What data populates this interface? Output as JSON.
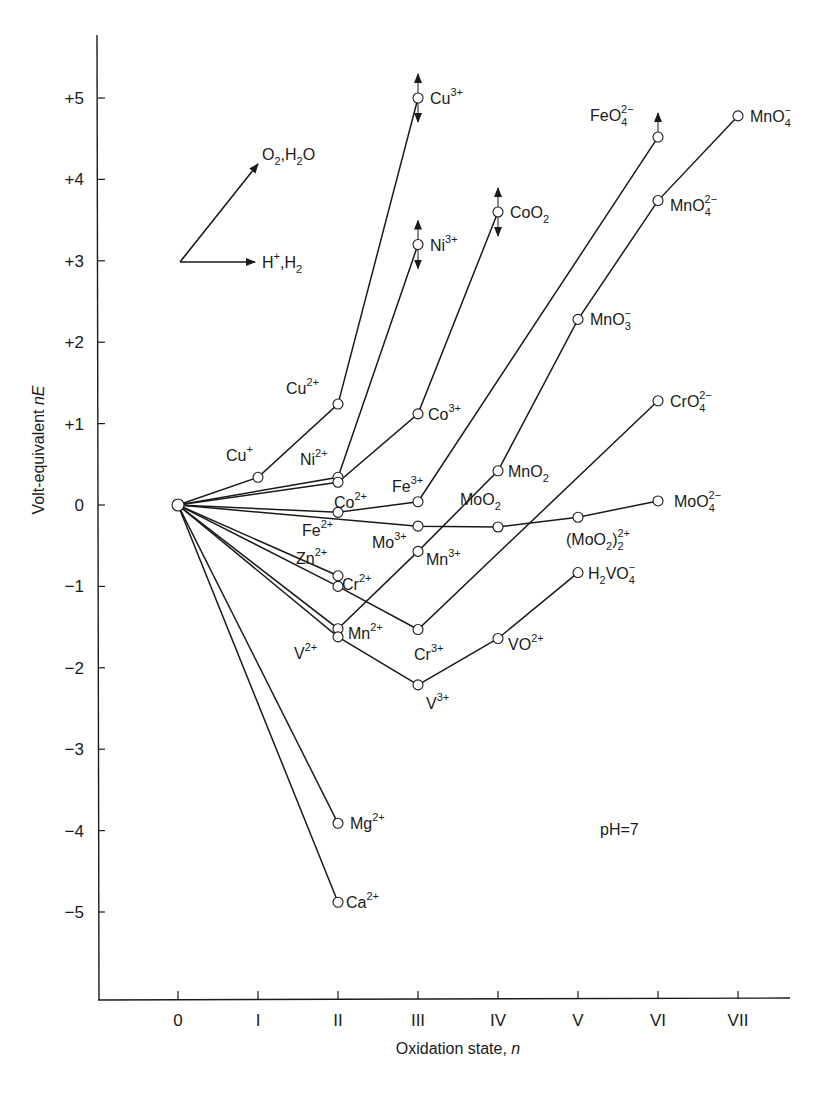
{
  "chart_data": {
    "type": "line",
    "title": "",
    "xlabel": "Oxidation state, n",
    "ylabel": "Volt-equivalent nE",
    "annotation": "pH=7",
    "legend_arrows": [
      {
        "label": "O2,H2O",
        "direction": "up-right"
      },
      {
        "label": "H+,H2",
        "direction": "right"
      }
    ],
    "x_ticks": [
      "0",
      "I",
      "II",
      "III",
      "IV",
      "V",
      "VI",
      "VII"
    ],
    "y_ticks": [
      "+5",
      "+4",
      "+3",
      "+2",
      "+1",
      "0",
      "−1",
      "−2",
      "−3",
      "−4",
      "−5"
    ],
    "xlim": [
      -1,
      7.5
    ],
    "ylim": [
      -6.3,
      5.8
    ],
    "grid": false,
    "origin_point": {
      "x": 0,
      "y": 0
    },
    "series": [
      {
        "name": "Cu",
        "points": [
          {
            "x": 0,
            "y": 0,
            "label": ""
          },
          {
            "x": 1,
            "y": 0.34,
            "label": "Cu⁺"
          },
          {
            "x": 2,
            "y": 1.24,
            "label": "Cu²⁺"
          },
          {
            "x": 3,
            "y": 5.0,
            "label": "Cu³⁺",
            "uncertain": true
          }
        ]
      },
      {
        "name": "Ni",
        "points": [
          {
            "x": 0,
            "y": 0,
            "label": ""
          },
          {
            "x": 2,
            "y": 0.34,
            "label": "Ni²⁺"
          },
          {
            "x": 3,
            "y": 3.2,
            "label": "Ni³⁺",
            "uncertain": true
          }
        ]
      },
      {
        "name": "Co",
        "points": [
          {
            "x": 0,
            "y": 0,
            "label": ""
          },
          {
            "x": 2,
            "y": 0.28,
            "label": "Co²⁺"
          },
          {
            "x": 3,
            "y": 1.12,
            "label": "Co³⁺"
          },
          {
            "x": 4,
            "y": 3.6,
            "label": "CoO₂",
            "uncertain": true
          }
        ]
      },
      {
        "name": "Fe",
        "points": [
          {
            "x": 0,
            "y": 0,
            "label": ""
          },
          {
            "x": 2,
            "y": -0.09,
            "label": "Fe²⁺"
          },
          {
            "x": 3,
            "y": 0.04,
            "label": "Fe³⁺"
          },
          {
            "x": 6,
            "y": 4.52,
            "label": "FeO₄²⁻",
            "uncertain": true
          }
        ]
      },
      {
        "name": "Mo",
        "points": [
          {
            "x": 0,
            "y": 0,
            "label": ""
          },
          {
            "x": 3,
            "y": -0.26,
            "label": "Mo³⁺"
          },
          {
            "x": 4,
            "y": -0.27,
            "label": "MoO₂"
          },
          {
            "x": 5,
            "y": -0.15,
            "label": "(MoO₂)₂²⁺"
          },
          {
            "x": 6,
            "y": 0.05,
            "label": "MoO₄²⁻"
          }
        ]
      },
      {
        "name": "Zn",
        "points": [
          {
            "x": 0,
            "y": 0,
            "label": ""
          },
          {
            "x": 2,
            "y": -0.87,
            "label": "Zn²⁺"
          }
        ]
      },
      {
        "name": "Cr",
        "points": [
          {
            "x": 0,
            "y": 0,
            "label": ""
          },
          {
            "x": 2,
            "y": -1.0,
            "label": "Cr²⁺"
          },
          {
            "x": 3,
            "y": -1.53,
            "label": "Cr³⁺"
          },
          {
            "x": 6,
            "y": 1.28,
            "label": "CrO₄²⁻"
          }
        ]
      },
      {
        "name": "Mn",
        "points": [
          {
            "x": 0,
            "y": 0,
            "label": ""
          },
          {
            "x": 2,
            "y": -1.52,
            "label": "Mn²⁺"
          },
          {
            "x": 3,
            "y": -0.57,
            "label": "Mn³⁺"
          },
          {
            "x": 4,
            "y": 0.42,
            "label": "MnO₂"
          },
          {
            "x": 5,
            "y": 2.28,
            "label": "MnO₃⁻"
          },
          {
            "x": 6,
            "y": 3.74,
            "label": "MnO₄²⁻"
          },
          {
            "x": 7,
            "y": 4.78,
            "label": "MnO₄⁻"
          }
        ]
      },
      {
        "name": "V",
        "points": [
          {
            "x": 0,
            "y": 0,
            "label": ""
          },
          {
            "x": 2,
            "y": -1.62,
            "label": "V²⁺"
          },
          {
            "x": 3,
            "y": -2.21,
            "label": "V³⁺"
          },
          {
            "x": 4,
            "y": -1.64,
            "label": "VO²⁺"
          },
          {
            "x": 5,
            "y": -0.83,
            "label": "H₂VO₄⁻"
          }
        ]
      },
      {
        "name": "Mg",
        "points": [
          {
            "x": 0,
            "y": 0,
            "label": ""
          },
          {
            "x": 2,
            "y": -3.91,
            "label": "Mg²⁺"
          }
        ]
      },
      {
        "name": "Ca",
        "points": [
          {
            "x": 0,
            "y": 0,
            "label": ""
          },
          {
            "x": 2,
            "y": -4.88,
            "label": "Ca²⁺"
          }
        ]
      }
    ]
  }
}
